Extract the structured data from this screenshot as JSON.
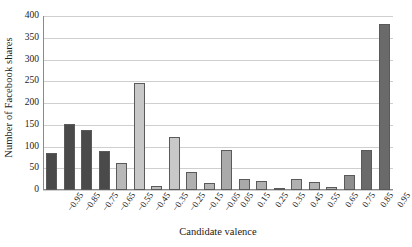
{
  "chart_data": {
    "type": "bar",
    "title": "",
    "subtitle": "",
    "xlabel": "Candidate valence",
    "ylabel": "Number of Facebook shares",
    "categories": [
      "−0.95",
      "−0.85",
      "−0.75",
      "−0.65",
      "−0.55",
      "−0.45",
      "−0.35",
      "−0.25",
      "−0.15",
      "−0.05",
      "0.05",
      "0.15",
      "0.25",
      "0.35",
      "0.45",
      "0.55",
      "0.65",
      "0.75",
      "0.85",
      "0.95"
    ],
    "values": [
      85,
      152,
      137,
      90,
      62,
      246,
      10,
      122,
      42,
      15,
      92,
      26,
      20,
      2,
      25,
      19,
      6,
      34,
      93,
      382
    ],
    "ylim": [
      0,
      400
    ],
    "ytick_labels": [
      "0",
      "50",
      "100",
      "150",
      "200",
      "250",
      "300",
      "350",
      "400"
    ],
    "ytick_values": [
      0,
      50,
      100,
      150,
      200,
      250,
      300,
      350,
      400
    ],
    "grid": "horizontal",
    "legend": "none",
    "bar_colors": [
      "#4a4a4a",
      "#4a4a4a",
      "#4a4a4a",
      "#4a4a4a",
      "#b8b8b8",
      "#c8c8c8",
      "#bcbcbc",
      "#c8c8c8",
      "#b0b0b0",
      "#b4b4b4",
      "#aaaaaa",
      "#a8a8a8",
      "#b0b0b0",
      "#b4b4b4",
      "#b0b0b0",
      "#b4b4b4",
      "#b0b0b0",
      "#8e8e8e",
      "#6a6a6a",
      "#6a6a6a"
    ],
    "bar_edge_color": "#5a5a5a",
    "gridline_color": "#cfcfcf",
    "axis_color": "#8a8a8a",
    "background_color": "#ffffff",
    "text_color": "#1a1a1a"
  }
}
